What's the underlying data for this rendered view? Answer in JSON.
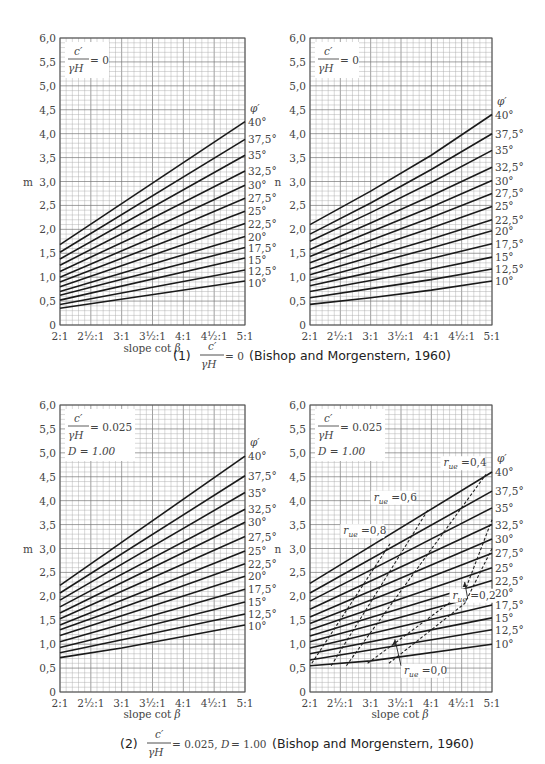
{
  "figure": {
    "caption1": {
      "prefix": "(1)",
      "frac_num": "c′",
      "frac_den": "γH",
      "eq": "= 0",
      "source": "(Bishop and Morgenstern, 1960)"
    },
    "caption2": {
      "prefix": "(2)",
      "frac_num": "c′",
      "frac_den": "γH",
      "eq": "= 0.025,",
      "d": "D",
      "d_eq": "= 1.00",
      "source": "(Bishop and Morgenstern, 1960)"
    }
  },
  "chart_data": [
    {
      "id": "tl",
      "type": "line",
      "title": "c'/γH = 0",
      "ylabel": "m",
      "xlabel": "slope cot β",
      "box": {
        "line1": "c′",
        "line2": "γH",
        "eq": "= 0"
      },
      "xticks": [
        "2:1",
        "2½:1",
        "3:1",
        "3½:1",
        "4:1",
        "4½:1",
        "5:1"
      ],
      "yticks": [
        "0",
        "0,5",
        "1,0",
        "1,5",
        "2,0",
        "2,5",
        "3,0",
        "3,5",
        "4,0",
        "4,5",
        "5,0",
        "5,5",
        "6,0"
      ],
      "xlim": [
        2,
        5
      ],
      "ylim": [
        0,
        6
      ],
      "grid": true,
      "legend_title": "φ′",
      "series": [
        {
          "name": "40°",
          "x": [
            2,
            5
          ],
          "values": [
            1.68,
            4.25
          ]
        },
        {
          "name": "37,5°",
          "x": [
            2,
            5
          ],
          "values": [
            1.52,
            3.88
          ]
        },
        {
          "name": "35°",
          "x": [
            2,
            5
          ],
          "values": [
            1.38,
            3.55
          ]
        },
        {
          "name": "32,5°",
          "x": [
            2,
            5
          ],
          "values": [
            1.25,
            3.22
          ]
        },
        {
          "name": "30°",
          "x": [
            2,
            5
          ],
          "values": [
            1.12,
            2.92
          ]
        },
        {
          "name": "27,5°",
          "x": [
            2,
            5
          ],
          "values": [
            1.0,
            2.65
          ]
        },
        {
          "name": "25°",
          "x": [
            2,
            5
          ],
          "values": [
            0.9,
            2.38
          ]
        },
        {
          "name": "22,5°",
          "x": [
            2,
            5
          ],
          "values": [
            0.8,
            2.12
          ]
        },
        {
          "name": "20°",
          "x": [
            2,
            5
          ],
          "values": [
            0.7,
            1.85
          ]
        },
        {
          "name": "17,5°",
          "x": [
            2,
            5
          ],
          "values": [
            0.62,
            1.62
          ]
        },
        {
          "name": "15°",
          "x": [
            2,
            5
          ],
          "values": [
            0.52,
            1.4
          ]
        },
        {
          "name": "12,5°",
          "x": [
            2,
            5
          ],
          "values": [
            0.43,
            1.15
          ]
        },
        {
          "name": "10°",
          "x": [
            2,
            5
          ],
          "values": [
            0.35,
            0.92
          ]
        }
      ]
    },
    {
      "id": "tr",
      "type": "line",
      "title": "c'/γH = 0",
      "ylabel": "n",
      "xlabel": "",
      "box": {
        "line1": "c′",
        "line2": "γH",
        "eq": "= 0"
      },
      "xticks": [
        "2:1",
        "2½:1",
        "3:1",
        "3½:1",
        "4:1",
        "4½:1",
        "5:1"
      ],
      "yticks": [
        "0",
        "0,5",
        "1,0",
        "1,5",
        "2,0",
        "2,5",
        "3,0",
        "3,5",
        "4,0",
        "4,5",
        "5,0",
        "5,5",
        "6,0"
      ],
      "xlim": [
        2,
        5
      ],
      "ylim": [
        0,
        6
      ],
      "grid": true,
      "legend_title": "φ′",
      "series": [
        {
          "name": "40°",
          "x": [
            2,
            3,
            4,
            5
          ],
          "values": [
            2.1,
            2.8,
            3.55,
            4.4
          ]
        },
        {
          "name": "37,5°",
          "x": [
            2,
            3,
            4,
            5
          ],
          "values": [
            1.9,
            2.55,
            3.25,
            4.0
          ]
        },
        {
          "name": "35°",
          "x": [
            2,
            3,
            4,
            5
          ],
          "values": [
            1.75,
            2.35,
            2.98,
            3.65
          ]
        },
        {
          "name": "32,5°",
          "x": [
            2,
            3,
            4,
            5
          ],
          "values": [
            1.58,
            2.13,
            2.7,
            3.3
          ]
        },
        {
          "name": "30°",
          "x": [
            2,
            3,
            4,
            5
          ],
          "values": [
            1.43,
            1.95,
            2.47,
            3.02
          ]
        },
        {
          "name": "27,5°",
          "x": [
            2,
            3,
            4,
            5
          ],
          "values": [
            1.3,
            1.77,
            2.25,
            2.75
          ]
        },
        {
          "name": "25°",
          "x": [
            2,
            3,
            4,
            5
          ],
          "values": [
            1.17,
            1.6,
            2.03,
            2.48
          ]
        },
        {
          "name": "22,5°",
          "x": [
            2,
            3,
            4,
            5
          ],
          "values": [
            1.05,
            1.42,
            1.8,
            2.2
          ]
        },
        {
          "name": "20°",
          "x": [
            2,
            3,
            4,
            5
          ],
          "values": [
            0.93,
            1.27,
            1.61,
            1.97
          ]
        },
        {
          "name": "17,5°",
          "x": [
            2,
            3,
            4,
            5
          ],
          "values": [
            0.82,
            1.1,
            1.39,
            1.7
          ]
        },
        {
          "name": "15°",
          "x": [
            2,
            3,
            4,
            5
          ],
          "values": [
            0.7,
            0.93,
            1.16,
            1.42
          ]
        },
        {
          "name": "12,5°",
          "x": [
            2,
            3,
            4,
            5
          ],
          "values": [
            0.57,
            0.76,
            0.95,
            1.17
          ]
        },
        {
          "name": "10°",
          "x": [
            2,
            3,
            4,
            5
          ],
          "values": [
            0.43,
            0.57,
            0.73,
            0.92
          ]
        }
      ]
    },
    {
      "id": "bl",
      "type": "line",
      "title": "c'/γH = 0.025, D = 1.00",
      "ylabel": "m",
      "xlabel": "slope cot β",
      "box": {
        "line1": "c′",
        "line2": "γH",
        "eq": "= 0.025",
        "line3": "D = 1.00"
      },
      "xticks": [
        "2:1",
        "2½:1",
        "3:1",
        "3½:1",
        "4:1",
        "4½:1",
        "5:1"
      ],
      "yticks": [
        "0",
        "0,5",
        "1,0",
        "1,5",
        "2,0",
        "2,5",
        "3,0",
        "3,5",
        "4,0",
        "4,5",
        "5,0",
        "5,5",
        "6,0"
      ],
      "xlim": [
        2,
        5
      ],
      "ylim": [
        0,
        6
      ],
      "grid": true,
      "legend_title": "φ′",
      "series": [
        {
          "name": "40°",
          "x": [
            2,
            5
          ],
          "values": [
            2.23,
            4.93
          ]
        },
        {
          "name": "37,5°",
          "x": [
            2,
            5
          ],
          "values": [
            2.07,
            4.52
          ]
        },
        {
          "name": "35°",
          "x": [
            2,
            5
          ],
          "values": [
            1.92,
            4.17
          ]
        },
        {
          "name": "32,5°",
          "x": [
            2,
            5
          ],
          "values": [
            1.78,
            3.82
          ]
        },
        {
          "name": "30°",
          "x": [
            2,
            5
          ],
          "values": [
            1.65,
            3.55
          ]
        },
        {
          "name": "27,5°",
          "x": [
            2,
            5
          ],
          "values": [
            1.53,
            3.25
          ]
        },
        {
          "name": "25°",
          "x": [
            2,
            5
          ],
          "values": [
            1.4,
            2.95
          ]
        },
        {
          "name": "22,5°",
          "x": [
            2,
            5
          ],
          "values": [
            1.3,
            2.68
          ]
        },
        {
          "name": "20°",
          "x": [
            2,
            5
          ],
          "values": [
            1.18,
            2.42
          ]
        },
        {
          "name": "17,5°",
          "x": [
            2,
            5
          ],
          "values": [
            1.05,
            2.15
          ]
        },
        {
          "name": "15°",
          "x": [
            2,
            5
          ],
          "values": [
            0.93,
            1.88
          ]
        },
        {
          "name": "12,5°",
          "x": [
            2,
            5
          ],
          "values": [
            0.82,
            1.63
          ]
        },
        {
          "name": "10°",
          "x": [
            2,
            3,
            5
          ],
          "values": [
            0.72,
            0.92,
            1.4
          ]
        }
      ]
    },
    {
      "id": "br",
      "type": "line",
      "title": "c'/γH = 0.025, D = 1.00",
      "ylabel": "n",
      "xlabel": "slope cot β",
      "box": {
        "line1": "c′",
        "line2": "γH",
        "eq": "= 0.025",
        "line3": "D = 1.00"
      },
      "xticks": [
        "2:1",
        "2½:1",
        "3:1",
        "3½:1",
        "4:1",
        "4½:1",
        "5:1"
      ],
      "yticks": [
        "0",
        "0,5",
        "1,0",
        "1,5",
        "2,0",
        "2,5",
        "3,0",
        "3,5",
        "4,0",
        "4,5",
        "5,0",
        "5,5",
        "6,0"
      ],
      "xlim": [
        2,
        5
      ],
      "ylim": [
        0,
        6
      ],
      "grid": true,
      "legend_title": "φ′",
      "series": [
        {
          "name": "40°",
          "x": [
            2,
            5
          ],
          "values": [
            2.27,
            4.6
          ]
        },
        {
          "name": "37,5°",
          "x": [
            2,
            5
          ],
          "values": [
            2.07,
            4.2
          ]
        },
        {
          "name": "35°",
          "x": [
            2,
            5
          ],
          "values": [
            1.9,
            3.85
          ]
        },
        {
          "name": "32,5°",
          "x": [
            2,
            5
          ],
          "values": [
            1.73,
            3.5
          ]
        },
        {
          "name": "30°",
          "x": [
            2,
            5
          ],
          "values": [
            1.57,
            3.2
          ]
        },
        {
          "name": "27,5°",
          "x": [
            2,
            5
          ],
          "values": [
            1.43,
            2.9
          ]
        },
        {
          "name": "25°",
          "x": [
            2,
            5
          ],
          "values": [
            1.3,
            2.6
          ]
        },
        {
          "name": "22,5°",
          "x": [
            2,
            5
          ],
          "values": [
            1.17,
            2.33
          ]
        },
        {
          "name": "20°",
          "x": [
            2,
            5
          ],
          "values": [
            1.05,
            2.08
          ]
        },
        {
          "name": "17,5°",
          "x": [
            2,
            5
          ],
          "values": [
            0.92,
            1.82
          ]
        },
        {
          "name": "15°",
          "x": [
            2,
            5
          ],
          "values": [
            0.8,
            1.55
          ]
        },
        {
          "name": "12,5°",
          "x": [
            2,
            5
          ],
          "values": [
            0.67,
            1.3
          ]
        },
        {
          "name": "10°",
          "x": [
            2,
            3,
            5
          ],
          "values": [
            0.55,
            0.65,
            1.0
          ]
        }
      ],
      "dashed_series": [
        {
          "name": "r_ue = 0.8",
          "label": "0,8",
          "x": [
            2.03,
            3.32
          ],
          "values": [
            0.6,
            3.1
          ],
          "label_pos": [
            2.55,
            3.3
          ]
        },
        {
          "name": "r_ue = 0.6",
          "label": "0,6",
          "x": [
            2.35,
            3.95
          ],
          "values": [
            0.55,
            3.82
          ],
          "label_pos": [
            3.05,
            4.0
          ]
        },
        {
          "name": "r_ue = 0.4",
          "label": "0,4",
          "x": [
            2.6,
            4.9
          ],
          "values": [
            0.55,
            4.55
          ],
          "label_pos": [
            4.2,
            4.72
          ]
        },
        {
          "name": "r_ue = 0.2",
          "label": "0,2",
          "x": [
            2.95,
            4.55,
            5.0
          ],
          "values": [
            0.6,
            2.1,
            3.6
          ],
          "label_pos": [
            4.35,
            1.95
          ]
        },
        {
          "name": "r_ue = 0.0",
          "label": "0,0",
          "x": [
            3.3,
            4.55,
            5.0
          ],
          "values": [
            0.6,
            1.85,
            3.0
          ],
          "label_pos": [
            3.55,
            0.38
          ]
        }
      ],
      "annotations": [
        {
          "text": "r_ue = 0.2",
          "arrow_to": [
            4.55,
            2.3
          ]
        },
        {
          "text": "r_ue = 0.0",
          "arrow_to": [
            3.4,
            1.1
          ]
        }
      ],
      "r_label": "r",
      "r_sub": "ue",
      "r_eq": "="
    }
  ]
}
